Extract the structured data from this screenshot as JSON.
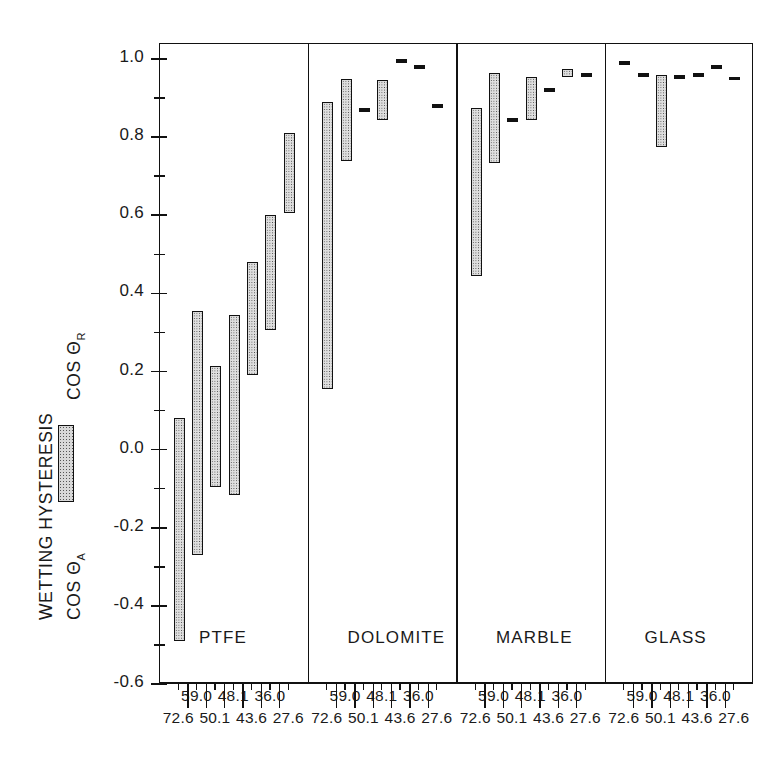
{
  "figure": {
    "ylabel_main": "WETTING HYSTERESIS",
    "ylabel_cos_r": "COS Θ",
    "ylabel_cos_r_sub": "R",
    "ylabel_cos_a": "COS Θ",
    "ylabel_cos_a_sub": "A",
    "legend_swatch_name": "hysteresis-bar-legend"
  },
  "chart_data": {
    "type": "bar",
    "title": "",
    "subtitle": "",
    "xlabel": "",
    "ylabel": "WETTING HYSTERESIS  (COS Θ_A – COS Θ_R)",
    "ylim": [
      -0.6,
      1.0
    ],
    "ytick_labels": [
      "1.0",
      "0.8",
      "0.6",
      "0.4",
      "0.2",
      "0.0",
      "-0.2",
      "-0.4",
      "-0.6"
    ],
    "ytick_values": [
      1.0,
      0.8,
      0.6,
      0.4,
      0.2,
      0.0,
      -0.2,
      -0.4,
      -0.6
    ],
    "yminor_values": [
      0.9,
      0.7,
      0.5,
      0.3,
      0.1,
      -0.1,
      -0.3,
      -0.5
    ],
    "grid": false,
    "legend_position": "left-axis",
    "categories": [
      "72.6",
      "59.0",
      "50.1",
      "48.1",
      "43.6",
      "36.0",
      "27.6"
    ],
    "category_note": "surface tension of probe liquid (mN/m)",
    "panels": [
      {
        "name": "PTFE",
        "bars": [
          {
            "category": "72.6",
            "cos_theta_a": 0.08,
            "cos_theta_r": -0.49
          },
          {
            "category": "59.0",
            "cos_theta_a": 0.355,
            "cos_theta_r": -0.27
          },
          {
            "category": "50.1",
            "cos_theta_a": 0.215,
            "cos_theta_r": -0.095
          },
          {
            "category": "48.1",
            "cos_theta_a": 0.345,
            "cos_theta_r": -0.115
          },
          {
            "category": "43.6",
            "cos_theta_a": 0.48,
            "cos_theta_r": 0.19
          },
          {
            "category": "36.0",
            "cos_theta_a": 0.6,
            "cos_theta_r": 0.305
          },
          {
            "category": "27.6",
            "cos_theta_a": 0.81,
            "cos_theta_r": 0.605
          }
        ]
      },
      {
        "name": "DOLOMITE",
        "bars": [
          {
            "category": "72.6",
            "cos_theta_a": 0.89,
            "cos_theta_r": 0.155
          },
          {
            "category": "59.0",
            "cos_theta_a": 0.95,
            "cos_theta_r": 0.74
          },
          {
            "category": "50.1",
            "cos_theta_a": 0.875,
            "cos_theta_r": 0.865
          },
          {
            "category": "48.1",
            "cos_theta_a": 0.945,
            "cos_theta_r": 0.845
          },
          {
            "category": "43.6",
            "cos_theta_a": 1.0,
            "cos_theta_r": 0.99
          },
          {
            "category": "36.0",
            "cos_theta_a": 0.985,
            "cos_theta_r": 0.975
          },
          {
            "category": "27.6",
            "cos_theta_a": 0.885,
            "cos_theta_r": 0.875
          }
        ]
      },
      {
        "name": "MARBLE",
        "bars": [
          {
            "category": "72.6",
            "cos_theta_a": 0.875,
            "cos_theta_r": 0.445
          },
          {
            "category": "59.0",
            "cos_theta_a": 0.965,
            "cos_theta_r": 0.735
          },
          {
            "category": "50.1",
            "cos_theta_a": 0.85,
            "cos_theta_r": 0.84
          },
          {
            "category": "48.1",
            "cos_theta_a": 0.955,
            "cos_theta_r": 0.845
          },
          {
            "category": "43.6",
            "cos_theta_a": 0.925,
            "cos_theta_r": 0.915
          },
          {
            "category": "36.0",
            "cos_theta_a": 0.975,
            "cos_theta_r": 0.955
          },
          {
            "category": "27.6",
            "cos_theta_a": 0.965,
            "cos_theta_r": 0.955
          }
        ]
      },
      {
        "name": "GLASS",
        "bars": [
          {
            "category": "72.6",
            "cos_theta_a": 0.995,
            "cos_theta_r": 0.985
          },
          {
            "category": "59.0",
            "cos_theta_a": 0.965,
            "cos_theta_r": 0.955
          },
          {
            "category": "50.1",
            "cos_theta_a": 0.96,
            "cos_theta_r": 0.775
          },
          {
            "category": "48.1",
            "cos_theta_a": 0.96,
            "cos_theta_r": 0.95
          },
          {
            "category": "43.6",
            "cos_theta_a": 0.965,
            "cos_theta_r": 0.955
          },
          {
            "category": "36.0",
            "cos_theta_a": 0.985,
            "cos_theta_r": 0.975
          },
          {
            "category": "27.6",
            "cos_theta_a": 0.955,
            "cos_theta_r": 0.945
          }
        ]
      }
    ]
  },
  "colors": {
    "axis": "#111111",
    "bar_fill": "#dedede",
    "bar_stipple": "#4a4a4a",
    "background": "#ffffff"
  }
}
